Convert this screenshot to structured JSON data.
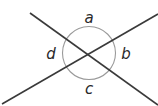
{
  "diagram": {
    "lines": [
      {
        "name": "line-1",
        "description": "upper-left to lower-right"
      },
      {
        "name": "line-2",
        "description": "lower-left to upper-right"
      }
    ],
    "angle_marker": "circle",
    "labels": {
      "top": "a",
      "right": "b",
      "bottom": "c",
      "left": "d"
    },
    "colors": {
      "line": "#3a3a3a",
      "circle": "#9a9a9a",
      "text": "#2a2a2a"
    }
  }
}
